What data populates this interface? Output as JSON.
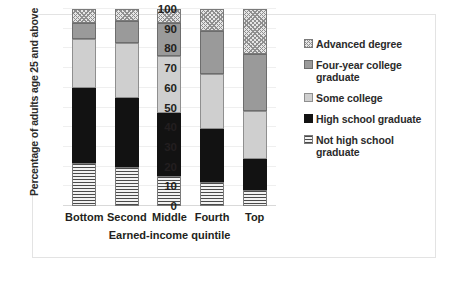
{
  "chart_data": {
    "type": "bar",
    "subtype": "stacked-bar-100",
    "title": "",
    "xlabel": "Earned-income quintile",
    "ylabel": "Percentage of adults age 25 and above",
    "categories": [
      "Bottom",
      "Second",
      "Middle",
      "Fourth",
      "Top"
    ],
    "ylim": [
      0,
      100
    ],
    "yticks": [
      0,
      10,
      20,
      30,
      40,
      50,
      60,
      70,
      80,
      90,
      100
    ],
    "ytick_labels": [
      "0",
      "10",
      "20",
      "30",
      "40",
      "50",
      "60",
      "70",
      "80",
      "90",
      "100"
    ],
    "grid": true,
    "legend_position": "right",
    "stack_order_bottom_to_top": [
      "Not high school graduate",
      "High school graduate",
      "Some college",
      "Four-year college graduate",
      "Advanced degree"
    ],
    "series": [
      {
        "name": "Not high school graduate",
        "pattern": "horizontal-stripes",
        "color": "#e8e8e8",
        "values": [
          22,
          20,
          15,
          12,
          8
        ]
      },
      {
        "name": "High school graduate",
        "pattern": "solid",
        "color": "#121212",
        "values": [
          38,
          35,
          32,
          27,
          16
        ]
      },
      {
        "name": "Some college",
        "pattern": "solid",
        "color": "#cfcfcf",
        "values": [
          25,
          28,
          29,
          28,
          24
        ]
      },
      {
        "name": "Four-year college graduate",
        "pattern": "solid",
        "color": "#9a9a9a",
        "values": [
          8,
          11,
          17,
          22,
          29
        ]
      },
      {
        "name": "Advanced degree",
        "pattern": "cross-hatch",
        "color": "#e6e6e6",
        "values": [
          7,
          6,
          7,
          11,
          23
        ]
      }
    ],
    "cumulative_tops": {
      "Bottom": [
        22,
        60,
        85,
        93,
        100
      ],
      "Second": [
        20,
        55,
        83,
        94,
        100
      ],
      "Middle": [
        15,
        47,
        76,
        93,
        100
      ],
      "Fourth": [
        12,
        39,
        67,
        89,
        100
      ],
      "Top": [
        8,
        24,
        48,
        77,
        100
      ]
    }
  },
  "legend": {
    "items": [
      {
        "label": "Advanced degree",
        "pattern": "cross-hatch"
      },
      {
        "label": "Four-year college graduate",
        "pattern": "solid-dark-gray"
      },
      {
        "label": "Some college",
        "pattern": "solid-light-gray"
      },
      {
        "label": "High school graduate",
        "pattern": "solid-black"
      },
      {
        "label": "Not high school graduate",
        "pattern": "horizontal-stripes"
      }
    ]
  }
}
